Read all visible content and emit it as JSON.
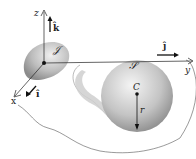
{
  "diagram": {
    "axes": {
      "z_label": "z",
      "y_label": "y",
      "x_label": "x"
    },
    "unit_vectors": {
      "k": "k̂",
      "j": "ĵ",
      "i": "î"
    },
    "bodies": {
      "small_body": {
        "label": "𝒥"
      },
      "sphere": {
        "label": "𝒮",
        "center_label": "C",
        "radius_label": "r"
      }
    },
    "colors": {
      "ink": "#222222",
      "sphere_light": "#f2f2f2",
      "sphere_dark": "#8a8a8a",
      "shadow": "#c8c8c8"
    }
  }
}
